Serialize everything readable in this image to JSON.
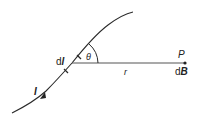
{
  "figure": {
    "labels": {
      "current_element_prefix": "d",
      "current_element_symbol": "l",
      "angle": "θ",
      "distance": "r",
      "point": "P",
      "field_prefix": "d",
      "field_symbol": "B",
      "current": "I"
    },
    "colors": {
      "line": "#2a2a2a",
      "text": "#222222",
      "background": "#ffffff"
    }
  }
}
